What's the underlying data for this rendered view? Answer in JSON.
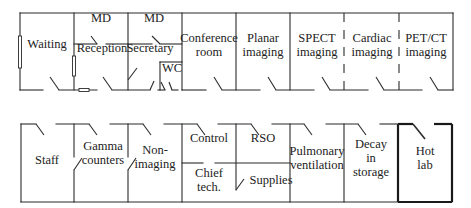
{
  "diagram": {
    "type": "floor_plan",
    "title": "",
    "top_row": [
      {
        "id": "waiting",
        "lines": [
          "Waiting"
        ],
        "x": 47,
        "y": 44
      },
      {
        "id": "md-1",
        "lines": [
          "MD"
        ],
        "x": 101,
        "y": 18
      },
      {
        "id": "reception",
        "lines": [
          "Reception"
        ],
        "x": 102,
        "y": 48
      },
      {
        "id": "md-2",
        "lines": [
          "MD"
        ],
        "x": 154,
        "y": 18
      },
      {
        "id": "secretary",
        "lines": [
          "Secretary"
        ],
        "x": 150,
        "y": 48
      },
      {
        "id": "wc",
        "lines": [
          "WC"
        ],
        "x": 172,
        "y": 68
      },
      {
        "id": "conference-room",
        "lines": [
          "Conference",
          "room"
        ],
        "x": 209,
        "y": 38
      },
      {
        "id": "planar-imaging",
        "lines": [
          "Planar",
          "imaging"
        ],
        "x": 263,
        "y": 38
      },
      {
        "id": "spect-imaging",
        "lines": [
          "SPECT",
          "imaging"
        ],
        "x": 317,
        "y": 38
      },
      {
        "id": "cardiac-imaging",
        "lines": [
          "Cardiac",
          "imaging"
        ],
        "x": 372,
        "y": 38
      },
      {
        "id": "pet-ct-imaging",
        "lines": [
          "PET/CT",
          "imaging"
        ],
        "x": 426,
        "y": 38
      }
    ],
    "bottom_row": [
      {
        "id": "staff",
        "lines": [
          "Staff"
        ],
        "x": 47,
        "y": 160
      },
      {
        "id": "gamma-counters",
        "lines": [
          "Gamma",
          "counters"
        ],
        "x": 103,
        "y": 146
      },
      {
        "id": "non-imaging",
        "lines": [
          "Non-",
          "imaging"
        ],
        "x": 155,
        "y": 150
      },
      {
        "id": "control",
        "lines": [
          "Control"
        ],
        "x": 209,
        "y": 138
      },
      {
        "id": "rso",
        "lines": [
          "RSO"
        ],
        "x": 263,
        "y": 138
      },
      {
        "id": "chief-tech",
        "lines": [
          "Chief",
          "tech."
        ],
        "x": 209,
        "y": 173
      },
      {
        "id": "supplies",
        "lines": [
          "Supplies"
        ],
        "x": 271,
        "y": 180
      },
      {
        "id": "pulmonary-ventilation",
        "lines": [
          "Pulmonary",
          "ventilation"
        ],
        "x": 317,
        "y": 151
      },
      {
        "id": "decay-in-storage",
        "lines": [
          "Decay",
          "in",
          "storage"
        ],
        "x": 371,
        "y": 144
      },
      {
        "id": "hot-lab",
        "lines": [
          "Hot",
          "lab"
        ],
        "x": 425,
        "y": 151
      }
    ],
    "colors": {
      "wall": "#2b2b2b",
      "background": "#ffffff",
      "text": "#222222"
    }
  }
}
